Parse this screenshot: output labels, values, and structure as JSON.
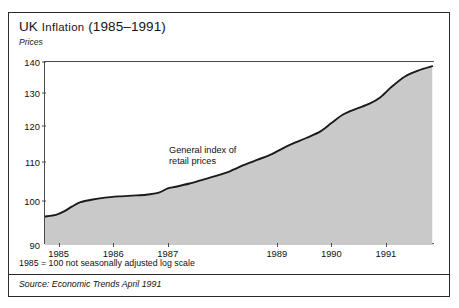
{
  "chart_data": {
    "type": "area",
    "title_main": "UK ",
    "title_smallcaps": "Inflation",
    "title_tail": " (1985–1991)",
    "subtitle": "Prices",
    "ylabel": "",
    "xlabel": "",
    "annotation": "General index of retail prices",
    "annotation_line1": "General index of",
    "annotation_line2": "retail prices",
    "footnote": "1985 = 100 not seasonally adjusted  log scale",
    "source": "Source: Economic Trends  April 1991",
    "scale": "log",
    "grid": false,
    "legend": "none",
    "ylim": [
      90,
      140
    ],
    "yticks": [
      90,
      100,
      110,
      120,
      130,
      140
    ],
    "ytick_labels": [
      "90",
      "100",
      "110",
      "120",
      "130",
      "140"
    ],
    "xticks": [
      1985,
      1986,
      1987,
      1989,
      1990,
      1991
    ],
    "xtick_labels": [
      "1985",
      "1986",
      "1987",
      "1989",
      "1990",
      "1991"
    ],
    "xlim": [
      1984.75,
      1991.9
    ],
    "fill_color": "#c9c9c9",
    "line_color": "#1a1a1a",
    "frame_color": "#2b2b2b",
    "series": [
      {
        "name": "General index of retail prices",
        "x": [
          1984.75,
          1984.95,
          1985.1,
          1985.25,
          1985.4,
          1985.6,
          1985.85,
          1986.1,
          1986.35,
          1986.6,
          1986.85,
          1987.0,
          1987.15,
          1987.4,
          1987.65,
          1987.9,
          1988.15,
          1988.4,
          1988.65,
          1988.9,
          1989.1,
          1989.3,
          1989.55,
          1989.8,
          1990.0,
          1990.2,
          1990.45,
          1990.7,
          1990.9,
          1991.1,
          1991.35,
          1991.6,
          1991.85
        ],
        "values": [
          96.4,
          96.8,
          97.6,
          98.8,
          99.8,
          100.4,
          100.9,
          101.2,
          101.4,
          101.6,
          102.2,
          103.2,
          103.6,
          104.4,
          105.4,
          106.4,
          107.6,
          109.2,
          110.6,
          112.0,
          113.6,
          115.0,
          116.6,
          118.4,
          120.8,
          123.2,
          125.0,
          126.6,
          128.6,
          131.8,
          135.2,
          137.2,
          138.6
        ]
      }
    ]
  }
}
